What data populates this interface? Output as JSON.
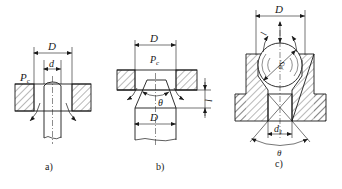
{
  "figure": {
    "colors": {
      "line": "#1a1a1a",
      "hatch": "#333333",
      "background": "#ffffff"
    }
  },
  "panels": [
    {
      "id": "a",
      "caption": "a)",
      "type": "flat seat with stem (poppet)",
      "labels": {
        "outer_diameter": "D",
        "inner_diameter": "d",
        "pressure": "P",
        "pressure_sub": "c"
      }
    },
    {
      "id": "b",
      "caption": "b)",
      "type": "conical seat",
      "labels": {
        "top_diameter": "D",
        "pressure": "P",
        "pressure_sub": "c",
        "angle": "θ",
        "lift": "l",
        "bottom_diameter": "D"
      }
    },
    {
      "id": "c",
      "caption": "c)",
      "type": "ball seat",
      "labels": {
        "outer_diameter": "D",
        "lift": "l",
        "sphere": "φS",
        "seat_diameter": "d",
        "seat_diameter_sub": "1",
        "angle": "θ"
      }
    }
  ]
}
